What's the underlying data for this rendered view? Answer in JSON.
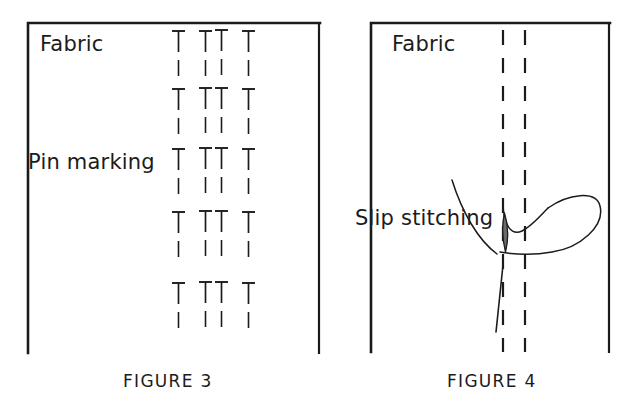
{
  "page": {
    "background_color": "#ffffff",
    "ink_color": "#1b1b1b",
    "width": 636,
    "height": 413
  },
  "figures": [
    {
      "id": "figure-3",
      "caption": "FIGURE 3",
      "frame": {
        "x": 28,
        "y": 22,
        "width": 292,
        "height": 330,
        "sides": [
          "top",
          "left",
          "right"
        ]
      },
      "labels": [
        {
          "name": "fabric-label",
          "text": "Fabric",
          "x": 40,
          "y": 34
        },
        {
          "name": "pin-marking-label",
          "text": "Pin marking",
          "x": 28,
          "y": 152
        }
      ],
      "pin_rows": [
        {
          "row": 1,
          "y": 30,
          "pin_x": [
            178,
            205,
            221,
            248
          ]
        },
        {
          "row": 2,
          "y": 88,
          "pin_x": [
            178,
            205,
            221,
            248
          ]
        },
        {
          "row": 3,
          "y": 148,
          "pin_x": [
            178,
            205,
            221,
            248
          ]
        },
        {
          "row": 4,
          "y": 208,
          "pin_x": [
            178,
            205,
            221,
            248
          ]
        },
        {
          "row": 5,
          "y": 280,
          "pin_x": [
            178,
            205,
            221,
            248
          ]
        }
      ],
      "pin_glyph": {
        "description": "sewing pin drawn as a T: horizontal head bar, vertical shaft, gap, then short lower dash",
        "head_width": 13,
        "shaft_length": 22,
        "gap": 8,
        "tail_length": 18
      }
    },
    {
      "id": "figure-4",
      "caption": "FIGURE 4",
      "frame": {
        "x": 370,
        "y": 22,
        "width": 240,
        "height": 330,
        "sides": [
          "top",
          "left",
          "right"
        ]
      },
      "labels": [
        {
          "name": "fabric-label",
          "text": "Fabric",
          "x": 392,
          "y": 34
        },
        {
          "name": "slip-stitching-label",
          "text": "Slip stitching",
          "x": 355,
          "y": 208
        }
      ],
      "dashed_fold_lines": [
        {
          "name": "fold-line-left",
          "x": 503,
          "y_start": 30,
          "y_end": 352
        },
        {
          "name": "fold-line-right",
          "x": 525,
          "y_start": 30,
          "y_end": 352
        }
      ],
      "needle": {
        "name": "needle",
        "eye_center": {
          "x": 504,
          "y": 228
        },
        "tip": {
          "x": 496,
          "y": 332
        }
      },
      "thread": {
        "name": "thread",
        "description": "long thread curving down from upper left into the fold, looping right in a slip stitch"
      }
    }
  ]
}
